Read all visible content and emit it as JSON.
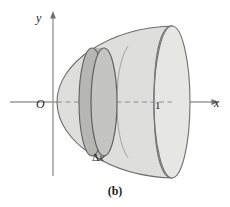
{
  "figure": {
    "caption": "(b)",
    "type": "3d-solid-of-revolution-diagram"
  },
  "axes": {
    "y_axis_label": "y",
    "x_axis_label": "x",
    "origin_label": "O",
    "x_tick_label": "1"
  },
  "annotations": {
    "thickness_delta": "Δ",
    "thickness_var": "x"
  },
  "colors": {
    "background": "#ffffff",
    "solid_fill": "#dededd",
    "solid_fill_light": "#e9e9e8",
    "disk_fill": "#bfbfbe",
    "disk_fill_dark": "#b0b0af",
    "outline": "#6e6e6e",
    "axis": "#8a8a8a",
    "text": "#231f20"
  },
  "geometry": {
    "axis_y_x": 53,
    "axis_y_top": 16,
    "axis_y_bottom": 176,
    "axis_x_y": 102,
    "axis_x_left": 10,
    "axis_x_right": 214,
    "tick_one_x": 160,
    "vertex_x": 57,
    "right_cap_x": 172,
    "right_cap_ry": 76,
    "right_cap_rx": 18,
    "disk_front_x": 104,
    "disk_back_x": 92,
    "disk_ry": 54,
    "disk_rx": 13
  }
}
